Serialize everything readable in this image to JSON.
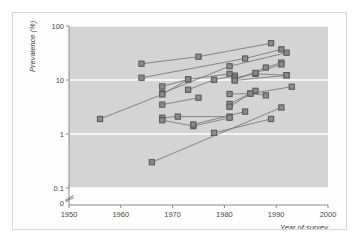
{
  "figure": {
    "background_color": "#ffffff",
    "frame_color": "#d8d8d8"
  },
  "chart_data": {
    "type": "line",
    "title": "",
    "subtitle": "",
    "xlabel": "Year of survey",
    "ylabel": "Prevalence (%)",
    "xlim": [
      1950,
      2000
    ],
    "ylim": [
      0.1,
      100
    ],
    "yscale": "log",
    "xscale": "linear",
    "grid": true,
    "grid_color": "#ffffff",
    "plot_background": "#d4d4d4",
    "legend": "none",
    "legend_position": "none",
    "marker": "square",
    "marker_color": "#8c8c8c",
    "marker_edge_color": "#5a5a5a",
    "line_color": "#6e6e6e",
    "xticks": [
      1950,
      1960,
      1970,
      1980,
      1990,
      2000
    ],
    "xtick_labels": [
      "1950",
      "1960",
      "1970",
      "1980",
      "1990",
      "2000"
    ],
    "yticks": [
      0.1,
      1,
      10,
      100
    ],
    "ytick_labels": [
      "0.1",
      "1",
      "10",
      "100"
    ],
    "axis_break": true,
    "origin_label": "0",
    "series": [
      {
        "name": "series-01",
        "x": [
          1964,
          1975,
          1989
        ],
        "values": [
          20.0,
          27.0,
          48.0
        ]
      },
      {
        "name": "series-02",
        "x": [
          1964,
          1984,
          1991
        ],
        "values": [
          11.0,
          25.0,
          37.0
        ]
      },
      {
        "name": "series-03",
        "x": [
          1968,
          1981,
          1992
        ],
        "values": [
          5.7,
          18.0,
          32.0
        ]
      },
      {
        "name": "series-04",
        "x": [
          1968,
          1973,
          1981
        ],
        "values": [
          7.6,
          10.3,
          13.0
        ]
      },
      {
        "name": "series-05",
        "x": [
          1973,
          1978,
          1982
        ],
        "values": [
          6.6,
          10.1,
          12.0
        ]
      },
      {
        "name": "series-06",
        "x": [
          1982,
          1986,
          1992
        ],
        "values": [
          11.0,
          13.0,
          12.3
        ]
      },
      {
        "name": "series-07",
        "x": [
          1982,
          1988,
          1991
        ],
        "values": [
          10.0,
          17.0,
          21.0
        ]
      },
      {
        "name": "series-08",
        "x": [
          1986,
          1991
        ],
        "values": [
          13.5,
          19.5
        ]
      },
      {
        "name": "series-09",
        "x": [
          1956,
          1968,
          1973
        ],
        "values": [
          1.9,
          5.4,
          10.3
        ]
      },
      {
        "name": "series-10",
        "x": [
          1968,
          1975
        ],
        "values": [
          3.5,
          4.7
        ]
      },
      {
        "name": "series-11",
        "x": [
          1981,
          1985,
          1988
        ],
        "values": [
          5.5,
          5.6,
          5.2
        ]
      },
      {
        "name": "series-12",
        "x": [
          1981,
          1986
        ],
        "values": [
          3.6,
          6.3
        ]
      },
      {
        "name": "series-13",
        "x": [
          1981,
          1985,
          1993
        ],
        "values": [
          3.2,
          5.6,
          7.5
        ]
      },
      {
        "name": "series-14",
        "x": [
          1968,
          1971,
          1981
        ],
        "values": [
          2.0,
          2.1,
          2.1
        ]
      },
      {
        "name": "series-15",
        "x": [
          1968,
          1974,
          1981
        ],
        "values": [
          1.8,
          1.4,
          2.0
        ]
      },
      {
        "name": "series-16",
        "x": [
          1974,
          1984
        ],
        "values": [
          1.5,
          2.6
        ]
      },
      {
        "name": "series-17",
        "x": [
          1978,
          1989
        ],
        "values": [
          1.05,
          1.9
        ]
      },
      {
        "name": "series-18",
        "x": [
          1966,
          1991
        ],
        "values": [
          0.3,
          3.1
        ]
      },
      {
        "name": "series-19",
        "x": [
          1982,
          1992
        ],
        "values": [
          9.8,
          12.2
        ]
      }
    ]
  }
}
